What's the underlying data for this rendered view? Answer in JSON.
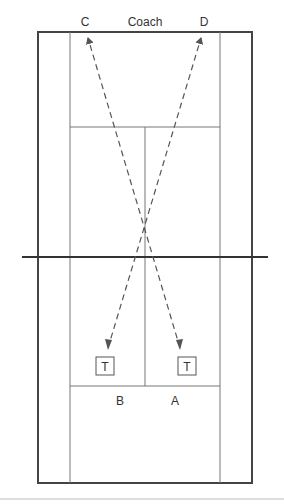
{
  "labels": {
    "coach": "Coach",
    "c": "C",
    "d": "D",
    "b": "B",
    "a": "A",
    "target_left": "T",
    "target_right": "T"
  },
  "colors": {
    "outer_line": "#444444",
    "inner_line": "#777777",
    "net": "#333333",
    "arrow": "#555555",
    "rule": "#bbbbbb"
  },
  "court": {
    "outer": {
      "x1": 38,
      "y1": 32,
      "x2": 252,
      "y2": 483
    },
    "singles_left_x": 70,
    "singles_right_x": 220,
    "center_x": 145,
    "service_top_y": 127,
    "service_bottom_y": 386,
    "net_y": 257
  },
  "arrows": [
    {
      "from": "A",
      "to": "C",
      "x1": 180,
      "y1": 348,
      "x2": 88,
      "y2": 38
    },
    {
      "from": "B",
      "to": "D",
      "x1": 108,
      "y1": 348,
      "x2": 201,
      "y2": 38
    }
  ]
}
